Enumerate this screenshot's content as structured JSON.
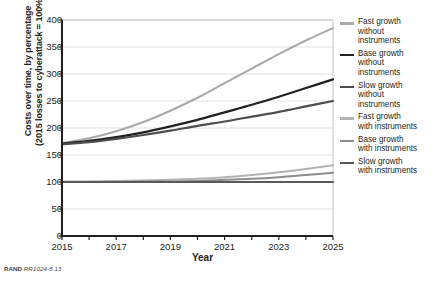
{
  "chart_data": {
    "type": "line",
    "title": "",
    "xlabel": "Year",
    "ylabel_lines": [
      "Costs over time, by percentage",
      "(2015 losses to cyberattack = 100%)"
    ],
    "x": [
      2015,
      2016,
      2017,
      2018,
      2019,
      2020,
      2021,
      2022,
      2023,
      2024,
      2025
    ],
    "xlim": [
      2015,
      2025
    ],
    "ylim": [
      0,
      400
    ],
    "xticks": [
      2015,
      2016,
      2017,
      2018,
      2019,
      2020,
      2021,
      2022,
      2023,
      2024,
      2025
    ],
    "xtick_labels": [
      "2015",
      "",
      "2017",
      "",
      "2019",
      "",
      "2021",
      "",
      "2023",
      "",
      "2025"
    ],
    "yticks": [
      0,
      50,
      100,
      150,
      200,
      250,
      300,
      350,
      400
    ],
    "ytick_labels": [
      "0",
      "50",
      "100",
      "150",
      "200",
      "250",
      "300",
      "350",
      "400"
    ],
    "grid": "horizontal",
    "legend_position": "right",
    "series": [
      {
        "name": "Fast growth without instruments",
        "label_lines": "Fast growth\nwithout\n instruments",
        "color": "#a9a9a9",
        "width": 2.0,
        "values": [
          172,
          181,
          194,
          211,
          232,
          256,
          283,
          310,
          337,
          362,
          385
        ]
      },
      {
        "name": "Base growth without instruments",
        "label_lines": "Base growth\nwithout\ninstruments",
        "color": "#231f20",
        "width": 2.2,
        "values": [
          171,
          176,
          183,
          192,
          203,
          215,
          229,
          243,
          258,
          274,
          290
        ]
      },
      {
        "name": "Slow growth without instruments",
        "label_lines": "Slow growth\nwithout\ninstruments",
        "color": "#4d4d4d",
        "width": 2.2,
        "values": [
          170,
          174,
          180,
          187,
          195,
          204,
          212,
          221,
          230,
          240,
          250
        ]
      },
      {
        "name": "Fast growth with instruments",
        "label_lines": "Fast growth\nwith instruments",
        "color": "#b3b3b3",
        "width": 2.0,
        "values": [
          101,
          101,
          102,
          103,
          104,
          106,
          109,
          113,
          118,
          124,
          131
        ]
      },
      {
        "name": "Base growth with instruments",
        "label_lines": "Base growth\nwith instruments",
        "color": "#8c8c8c",
        "width": 2.0,
        "values": [
          100,
          100,
          100,
          101,
          101,
          102,
          104,
          106,
          109,
          113,
          117
        ]
      },
      {
        "name": "Slow growth with instruments",
        "label_lines": "Slow growth\nwith instruments",
        "color": "#595959",
        "width": 2.0,
        "values": [
          100,
          100,
          100,
          100,
          100,
          100,
          100,
          100,
          100,
          100,
          100
        ]
      }
    ]
  },
  "footer": {
    "brand": "RAND",
    "reference": "RR1024-5.13"
  },
  "colors": {
    "axis": "#231f20",
    "grid": "#d9d9d9",
    "text": "#231f20"
  }
}
